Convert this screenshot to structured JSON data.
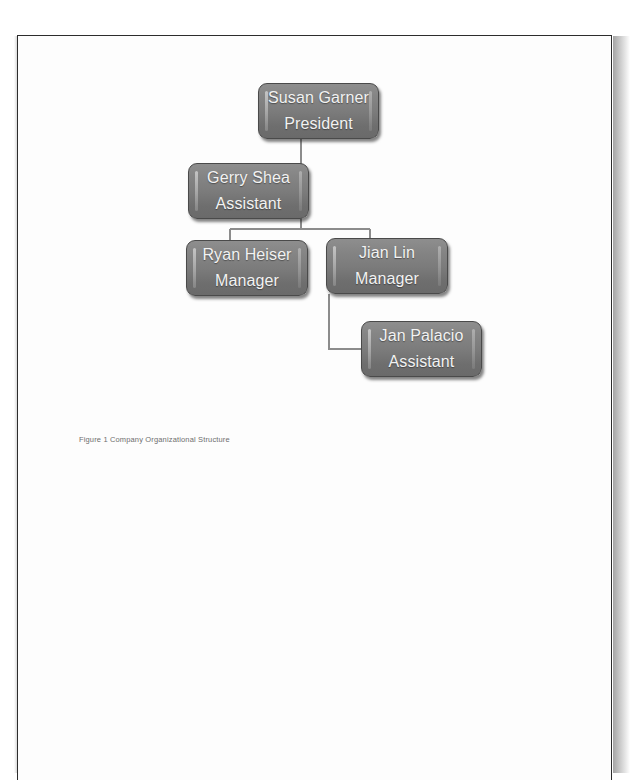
{
  "document": {
    "background_color": "#ffffff",
    "page_color": "#fdfdfd",
    "page_border_color": "#2c2c2c"
  },
  "figure": {
    "caption": "Figure 1 Company Organizational Structure",
    "caption_color": "#6e6e6e",
    "node_fill_color": "#7b7b7b",
    "node_text_color": "#f2f2f2",
    "connector_color": "#8c8c8c",
    "type": "org-chart",
    "nodes": [
      {
        "id": "president",
        "name": "Susan Garner",
        "role": "President",
        "x": 240,
        "y": 82,
        "w": 121,
        "h": 56
      },
      {
        "id": "assistant-1",
        "name": "Gerry Shea",
        "role": "Assistant",
        "x": 170,
        "y": 162,
        "w": 121,
        "h": 56
      },
      {
        "id": "manager-1",
        "name": "Ryan Heiser",
        "role": "Manager",
        "x": 168,
        "y": 239,
        "w": 122,
        "h": 56
      },
      {
        "id": "manager-2",
        "name": "Jian Lin",
        "role": "Manager",
        "x": 308,
        "y": 237,
        "w": 122,
        "h": 56
      },
      {
        "id": "assistant-2",
        "name": "Jan Palacio",
        "role": "Assistant",
        "x": 343,
        "y": 320,
        "w": 121,
        "h": 56
      }
    ],
    "edges": [
      {
        "from": "president",
        "to": "assistant-1",
        "style": "elbow-left"
      },
      {
        "from": "president",
        "to": "manager-1",
        "style": "elbow-split"
      },
      {
        "from": "president",
        "to": "manager-2",
        "style": "elbow-split"
      },
      {
        "from": "manager-2",
        "to": "assistant-2",
        "style": "elbow-left"
      }
    ]
  }
}
